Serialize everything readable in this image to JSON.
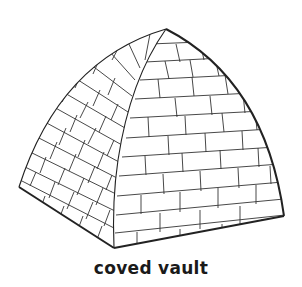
{
  "figure": {
    "caption": "coved vault",
    "colors": {
      "background": "#ffffff",
      "line": "#2a2a2a"
    }
  }
}
